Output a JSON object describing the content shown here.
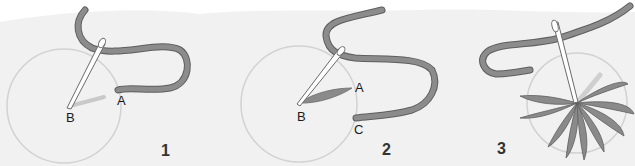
{
  "diagram": {
    "type": "embroidery-stitch-steps",
    "colors": {
      "paper": "#f1f1f1",
      "thread": "#8a8a8a",
      "thread_edge": "#5e5e5e",
      "circle": "#cfcfcf",
      "needle": "#ffffff",
      "needle_edge": "#6a6a6a"
    },
    "steps": [
      {
        "number": "1",
        "labels": {
          "A": "A",
          "B": "B"
        }
      },
      {
        "number": "2",
        "labels": {
          "A": "A",
          "B": "B",
          "C": "C"
        }
      },
      {
        "number": "3",
        "labels": {}
      }
    ]
  }
}
